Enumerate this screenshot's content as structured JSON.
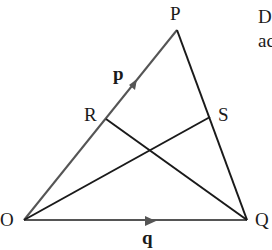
{
  "diagram": {
    "points": {
      "P": {
        "label": "P",
        "x": 177,
        "y": 30
      },
      "O": {
        "label": "O",
        "x": 24,
        "y": 220
      },
      "Q": {
        "label": "Q",
        "x": 247,
        "y": 220
      },
      "R": {
        "label": "R",
        "x": 106,
        "y": 119
      },
      "S": {
        "label": "S",
        "x": 210,
        "y": 117
      }
    },
    "vectors": {
      "p": {
        "label": "p",
        "from": "O",
        "to": "P"
      },
      "q": {
        "label": "q",
        "from": "O",
        "to": "Q"
      }
    },
    "segments": [
      "OP",
      "OQ",
      "PQ",
      "RQ",
      "OS"
    ],
    "colors": {
      "line": "#1a1a1a",
      "vector_line": "#555555",
      "text": "#1a1a1a"
    }
  },
  "cropped_text": {
    "line1": "D",
    "line2": "ac"
  }
}
